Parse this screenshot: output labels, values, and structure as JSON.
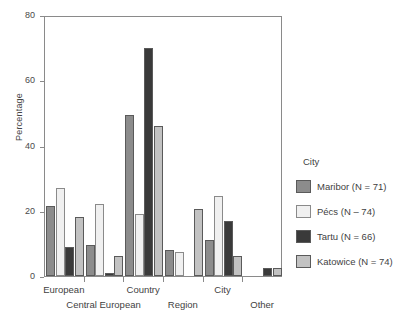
{
  "chart_data": {
    "type": "bar",
    "title": "",
    "xlabel": "",
    "ylabel": "Percentage",
    "ylim": [
      0,
      80
    ],
    "yticks": [
      0,
      20,
      40,
      60,
      80
    ],
    "grid": false,
    "legend_position": "right",
    "legend_title": "City",
    "categories": [
      "European",
      "Central European",
      "Country",
      "Region",
      "City",
      "Other"
    ],
    "series": [
      {
        "name": "Maribor (N = 71)",
        "color": "#8c8c8c",
        "values": [
          21.5,
          9.5,
          49.5,
          8.0,
          11.0,
          0.0
        ]
      },
      {
        "name": "Pécs (N – 74)",
        "color": "#f0f0f0",
        "values": [
          27.0,
          22.0,
          19.0,
          7.5,
          24.5,
          0.0
        ]
      },
      {
        "name": "Tartu (N = 66)",
        "color": "#3a3a3a",
        "values": [
          9.0,
          1.0,
          70.0,
          0.0,
          17.0,
          2.5
        ]
      },
      {
        "name": "Katowice (N = 74)",
        "color": "#c2c2c2",
        "values": [
          18.0,
          6.0,
          46.0,
          20.5,
          6.0,
          2.5
        ]
      }
    ]
  },
  "axes": {
    "y_title": "Percentage",
    "y_tick_labels": [
      "0",
      "20",
      "40",
      "60",
      "80"
    ],
    "x_row1_labels": [
      "European",
      "Country",
      "City"
    ],
    "x_row2_labels": [
      "Central European",
      "Region",
      "Other"
    ]
  },
  "legend": {
    "title": "City",
    "items": [
      {
        "label": "Maribor (N = 71)"
      },
      {
        "label": "Pécs (N – 74)"
      },
      {
        "label": "Tartu (N = 66)"
      },
      {
        "label": "Katowice (N = 74)"
      }
    ]
  },
  "colors": {
    "maribor": "#8c8c8c",
    "pecs": "#f0f0f0",
    "tartu": "#3a3a3a",
    "katowice": "#c2c2c2",
    "axis": "#8a8a8a",
    "text": "#3f3f3f",
    "background": "#ffffff"
  }
}
